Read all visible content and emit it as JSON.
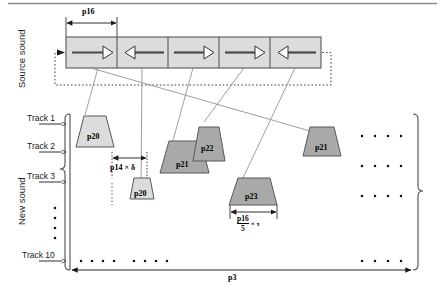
{
  "figure": {
    "axis_labels": {
      "source": "Source sound",
      "result": "New sound"
    }
  },
  "source_sound": {
    "label": "Source sound",
    "grain_width_label": "p16",
    "segments": [
      {
        "id": "seg-1",
        "direction": "right",
        "arrow": "→"
      },
      {
        "id": "seg-2",
        "direction": "left",
        "arrow": "←"
      },
      {
        "id": "seg-3",
        "direction": "right",
        "arrow": "→"
      },
      {
        "id": "seg-4",
        "direction": "right",
        "arrow": "→"
      },
      {
        "id": "seg-5",
        "direction": "left",
        "arrow": "←"
      }
    ],
    "loop_back": "dashed-feedback-loop"
  },
  "new_sound": {
    "label": "New sound",
    "tracks": [
      {
        "name": "Track 1"
      },
      {
        "name": "Track 2"
      },
      {
        "name": "Track 3"
      },
      {
        "name": "Track 10"
      }
    ],
    "vertical_ellipsis": "⋮",
    "grains": [
      {
        "id": "grain-p20-a",
        "label": "p20",
        "track": "Track 1"
      },
      {
        "id": "grain-p20-b",
        "label": "p20",
        "track": "Track 2"
      },
      {
        "id": "grain-p21-a",
        "label": "p21",
        "track": "Track 2"
      },
      {
        "id": "grain-p22",
        "label": "p22",
        "track": "Track 1"
      },
      {
        "id": "grain-p21-b",
        "label": "p21",
        "track": "Track 1"
      },
      {
        "id": "grain-p23",
        "label": "p23",
        "track": "Track 3"
      }
    ],
    "dot_rows": [
      {
        "row": "Track 1",
        "dots": 4
      },
      {
        "row": "Track 2",
        "dots": 4
      },
      {
        "row": "Track 3",
        "dots": 4
      },
      {
        "row": "Track 10",
        "dots": 4
      }
    ],
    "bottom_dots_left": 4,
    "bottom_dots_right": 4
  },
  "dimensions": {
    "offset_label": "p14 × δ",
    "grain_duration_numerator": "p16",
    "grain_duration_denominator": "5",
    "grain_duration_tail": "× τ",
    "total_length_label": "p3"
  },
  "colors": {
    "segment_fill": "#dcdcdc",
    "grain_fill_light": "#dcdcdc",
    "grain_fill_dark": "#a9a9a9",
    "stroke": "#555555",
    "text": "#000000"
  }
}
